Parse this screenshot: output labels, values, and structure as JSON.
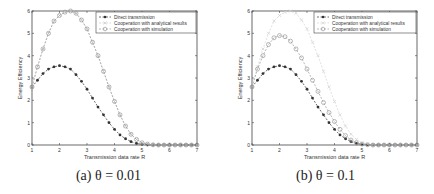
{
  "chart_data": [
    {
      "type": "line",
      "caption": "(a) θ = 0.01",
      "xlabel": "Transmission data rate R",
      "ylabel": "Energy Efficiency",
      "xlim": [
        1,
        7
      ],
      "ylim": [
        0,
        6
      ],
      "xticks": [
        1,
        2,
        3,
        4,
        5,
        6,
        7
      ],
      "yticks": [
        0,
        1,
        2,
        3,
        4,
        5,
        6
      ],
      "grid": false,
      "legend_position": "upper right",
      "x": [
        1,
        1.2,
        1.4,
        1.6,
        1.8,
        2,
        2.2,
        2.4,
        2.6,
        2.8,
        3,
        3.2,
        3.4,
        3.6,
        3.8,
        4,
        4.2,
        4.4,
        4.6,
        4.8,
        5,
        5.2,
        5.4,
        5.6,
        5.8,
        6,
        6.2,
        6.4,
        6.6,
        6.8,
        7
      ],
      "series": [
        {
          "name": "Direct transmission",
          "marker": "*",
          "color": "#333333",
          "values": [
            2.6,
            2.9,
            3.2,
            3.4,
            3.5,
            3.55,
            3.5,
            3.4,
            3.15,
            2.85,
            2.5,
            2.1,
            1.7,
            1.35,
            1.0,
            0.7,
            0.45,
            0.28,
            0.15,
            0.07,
            0.03,
            0.01,
            0,
            0,
            0,
            0,
            0,
            0,
            0,
            0,
            0
          ]
        },
        {
          "name": "Cooperation with analytical results",
          "marker": "x",
          "color": "#c8c8c8",
          "values": [
            2.6,
            3.5,
            4.3,
            5.0,
            5.55,
            5.8,
            5.95,
            6.0,
            5.9,
            5.6,
            5.2,
            4.6,
            4.0,
            3.3,
            2.6,
            1.95,
            1.35,
            0.85,
            0.48,
            0.25,
            0.1,
            0.04,
            0.01,
            0,
            0,
            0,
            0,
            0,
            0,
            0,
            0
          ]
        },
        {
          "name": "Cooperation with simulation",
          "marker": "o",
          "color": "#999999",
          "values": [
            2.6,
            3.5,
            4.3,
            5.0,
            5.55,
            5.8,
            5.95,
            6.0,
            5.9,
            5.6,
            5.2,
            4.6,
            4.0,
            3.3,
            2.6,
            1.95,
            1.35,
            0.85,
            0.48,
            0.25,
            0.1,
            0.04,
            0.01,
            0,
            0,
            0,
            0,
            0,
            0,
            0,
            0
          ]
        }
      ]
    },
    {
      "type": "line",
      "caption": "(b) θ = 0.1",
      "xlabel": "Transmission data rate R",
      "ylabel": "Energy Efficiency",
      "xlim": [
        1,
        7
      ],
      "ylim": [
        0,
        6
      ],
      "xticks": [
        1,
        2,
        3,
        4,
        5,
        6,
        7
      ],
      "yticks": [
        0,
        1,
        2,
        3,
        4,
        5,
        6
      ],
      "grid": false,
      "legend_position": "upper right",
      "x": [
        1,
        1.2,
        1.4,
        1.6,
        1.8,
        2,
        2.2,
        2.4,
        2.6,
        2.8,
        3,
        3.2,
        3.4,
        3.6,
        3.8,
        4,
        4.2,
        4.4,
        4.6,
        4.8,
        5,
        5.2,
        5.4,
        5.6,
        5.8,
        6,
        6.2,
        6.4,
        6.6,
        6.8,
        7
      ],
      "series": [
        {
          "name": "Direct transmission",
          "marker": "*",
          "color": "#333333",
          "values": [
            2.6,
            2.9,
            3.2,
            3.4,
            3.5,
            3.55,
            3.5,
            3.4,
            3.15,
            2.85,
            2.5,
            2.1,
            1.7,
            1.35,
            1.0,
            0.7,
            0.45,
            0.28,
            0.15,
            0.07,
            0.03,
            0.01,
            0,
            0,
            0,
            0,
            0,
            0,
            0,
            0,
            0
          ]
        },
        {
          "name": "Cooperation with analytical results",
          "marker": "x",
          "color": "#d2d2d2",
          "values": [
            2.6,
            3.5,
            4.3,
            5.0,
            5.55,
            5.8,
            5.95,
            6.0,
            5.9,
            5.6,
            5.2,
            4.6,
            4.0,
            3.3,
            2.6,
            1.95,
            1.35,
            0.85,
            0.48,
            0.25,
            0.1,
            0.04,
            0.01,
            0,
            0,
            0,
            0,
            0,
            0,
            0,
            0
          ]
        },
        {
          "name": "Cooperation with simulation",
          "marker": "o",
          "color": "#999999",
          "values": [
            2.6,
            3.4,
            4.0,
            4.5,
            4.8,
            4.9,
            4.85,
            4.65,
            4.3,
            3.9,
            3.4,
            2.9,
            2.4,
            1.9,
            1.45,
            1.05,
            0.7,
            0.42,
            0.22,
            0.1,
            0.04,
            0.01,
            0,
            0,
            0,
            0,
            0,
            0,
            0,
            0,
            0
          ]
        }
      ]
    }
  ]
}
